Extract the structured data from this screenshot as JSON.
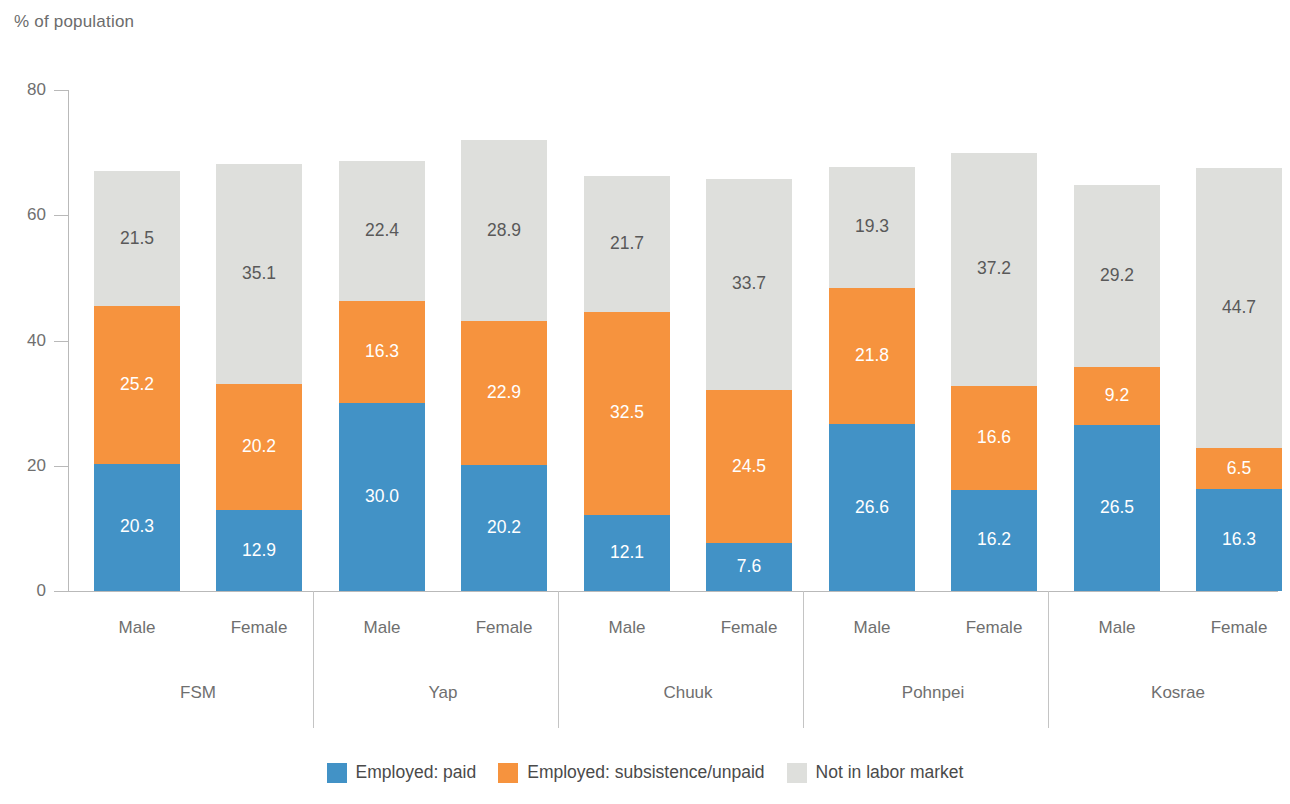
{
  "chart_data": {
    "type": "bar",
    "subtype": "stacked-bar-grouped",
    "title": "",
    "ylabel": "% of population",
    "xlabel": "",
    "ylim": [
      0,
      80
    ],
    "yticks": [
      0,
      20,
      40,
      60,
      80
    ],
    "grid": false,
    "legend_position": "bottom-center",
    "stacked": true,
    "groups": [
      "FSM",
      "Yap",
      "Chuuk",
      "Pohnpei",
      "Kosrae"
    ],
    "subcategories": [
      "Male",
      "Female"
    ],
    "categories": [
      "FSM Male",
      "FSM Female",
      "Yap Male",
      "Yap Female",
      "Chuuk Male",
      "Chuuk Female",
      "Pohnpei Male",
      "Pohnpei Female",
      "Kosrae Male",
      "Kosrae Female"
    ],
    "series": [
      {
        "name": "Employed: paid",
        "color": "#4292c6",
        "values": [
          20.3,
          12.9,
          30.0,
          20.2,
          12.1,
          7.6,
          26.6,
          16.2,
          26.5,
          16.3
        ]
      },
      {
        "name": "Employed: subsistence/unpaid",
        "color": "#f6933e",
        "values": [
          25.2,
          20.2,
          16.3,
          22.9,
          32.5,
          24.5,
          21.8,
          16.6,
          9.2,
          6.5
        ]
      },
      {
        "name": "Not in labor market",
        "color": "#dedfdc",
        "values": [
          21.5,
          35.1,
          22.4,
          28.9,
          21.7,
          33.7,
          19.3,
          37.2,
          29.2,
          44.7
        ]
      }
    ],
    "bars": [
      {
        "group": "FSM",
        "sex": "Male",
        "paid": "20.3",
        "unpaid": "25.2",
        "notinlabor": "21.5"
      },
      {
        "group": "FSM",
        "sex": "Female",
        "paid": "12.9",
        "unpaid": "20.2",
        "notinlabor": "35.1"
      },
      {
        "group": "Yap",
        "sex": "Male",
        "paid": "30.0",
        "unpaid": "16.3",
        "notinlabor": "22.4"
      },
      {
        "group": "Yap",
        "sex": "Female",
        "paid": "20.2",
        "unpaid": "22.9",
        "notinlabor": "28.9"
      },
      {
        "group": "Chuuk",
        "sex": "Male",
        "paid": "12.1",
        "unpaid": "32.5",
        "notinlabor": "21.7"
      },
      {
        "group": "Chuuk",
        "sex": "Female",
        "paid": "7.6",
        "unpaid": "24.5",
        "notinlabor": "33.7"
      },
      {
        "group": "Pohnpei",
        "sex": "Male",
        "paid": "26.6",
        "unpaid": "21.8",
        "notinlabor": "19.3"
      },
      {
        "group": "Pohnpei",
        "sex": "Female",
        "paid": "16.2",
        "unpaid": "16.6",
        "notinlabor": "37.2"
      },
      {
        "group": "Kosrae",
        "sex": "Male",
        "paid": "26.5",
        "unpaid": "9.2",
        "notinlabor": "29.2"
      },
      {
        "group": "Kosrae",
        "sex": "Female",
        "paid": "16.3",
        "unpaid": "6.5",
        "notinlabor": "44.7"
      }
    ]
  },
  "axis": {
    "y_title": "% of population",
    "y_tick_labels": [
      "80",
      "60",
      "40",
      "20",
      "0"
    ]
  },
  "legend": {
    "items": [
      {
        "label": "Employed: paid",
        "color": "#4292c6"
      },
      {
        "label": "Employed: subsistence/unpaid",
        "color": "#f6933e"
      },
      {
        "label": "Not in labor market",
        "color": "#dedfdc"
      }
    ]
  }
}
